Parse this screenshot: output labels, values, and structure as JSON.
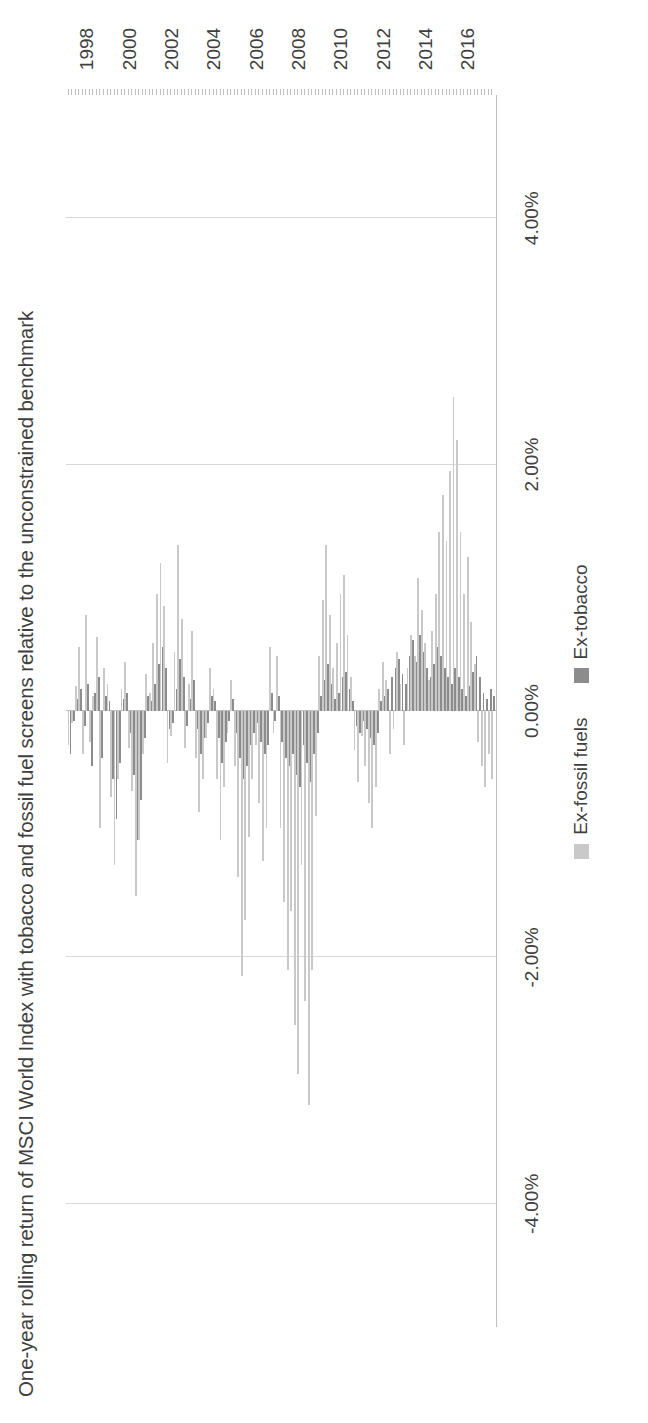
{
  "chart": {
    "title": "One-year rolling return of MSCI World Index with tobacco and fossil fuel screens relative to the unconstrained benchmark",
    "orientation": "rotated-90-ccw",
    "value_axis": {
      "labels": [
        "4.00%",
        "2.00%",
        "0.00%",
        "-2.00%",
        "-4.00%"
      ],
      "values": [
        4,
        2,
        0,
        -2,
        -4
      ],
      "min": -5,
      "max": 5
    },
    "category_axis": {
      "labels": [
        "1998",
        "2000",
        "2002",
        "2004",
        "2006",
        "2008",
        "2010",
        "2012",
        "2014",
        "2016"
      ],
      "values": [
        1998,
        2000,
        2002,
        2004,
        2006,
        2008,
        2010,
        2012,
        2014,
        2016
      ],
      "min": 1997.0,
      "max": 2017.3
    },
    "legend": {
      "position": "bottom",
      "items": [
        {
          "label": "Ex-fossil fuels",
          "color": "#c9c9c9"
        },
        {
          "label": "Ex-tobacco",
          "color": "#8c8c8c"
        }
      ]
    },
    "colors": {
      "ex_fossil_fuels": "#c9c9c9",
      "ex_tobacco": "#8c8c8c",
      "gridline": "#d9d9d9",
      "axis": "#bfbfbf",
      "text": "#3f3f3f",
      "background": "#ffffff"
    }
  },
  "chart_data": {
    "type": "bar",
    "title": "One-year rolling return of MSCI World Index with tobacco and fossil fuel screens relative to the unconstrained benchmark",
    "xlabel": "",
    "ylabel": "",
    "ylim": [
      -5,
      5
    ],
    "xlim": [
      1997.0,
      2017.3
    ],
    "grid": true,
    "legend_position": "bottom",
    "units": "percent",
    "x": [
      1997.08,
      1997.25,
      1997.42,
      1997.58,
      1997.75,
      1997.92,
      1998.08,
      1998.25,
      1998.42,
      1998.58,
      1998.75,
      1998.92,
      1999.08,
      1999.25,
      1999.42,
      1999.58,
      1999.75,
      1999.92,
      2000.08,
      2000.25,
      2000.42,
      2000.58,
      2000.75,
      2000.92,
      2001.08,
      2001.25,
      2001.42,
      2001.58,
      2001.75,
      2001.92,
      2002.08,
      2002.25,
      2002.42,
      2002.58,
      2002.75,
      2002.92,
      2003.08,
      2003.25,
      2003.42,
      2003.58,
      2003.75,
      2003.92,
      2004.08,
      2004.25,
      2004.42,
      2004.58,
      2004.75,
      2004.92,
      2005.08,
      2005.25,
      2005.42,
      2005.58,
      2005.75,
      2005.92,
      2006.08,
      2006.25,
      2006.42,
      2006.58,
      2006.75,
      2006.92,
      2007.08,
      2007.25,
      2007.42,
      2007.58,
      2007.75,
      2007.92,
      2008.08,
      2008.25,
      2008.42,
      2008.58,
      2008.75,
      2008.92,
      2009.08,
      2009.25,
      2009.42,
      2009.58,
      2009.75,
      2009.92,
      2010.08,
      2010.25,
      2010.42,
      2010.58,
      2010.75,
      2010.92,
      2011.08,
      2011.25,
      2011.42,
      2011.58,
      2011.75,
      2011.92,
      2012.08,
      2012.25,
      2012.42,
      2012.58,
      2012.75,
      2012.92,
      2013.08,
      2013.25,
      2013.42,
      2013.58,
      2013.75,
      2013.92,
      2014.08,
      2014.25,
      2014.42,
      2014.58,
      2014.75,
      2014.92,
      2015.08,
      2015.25,
      2015.42,
      2015.58,
      2015.75,
      2015.92,
      2016.08,
      2016.25,
      2016.42,
      2016.58,
      2016.75,
      2016.92,
      2017.08
    ],
    "series": [
      {
        "name": "Ex-fossil fuels",
        "color": "#c9c9c9",
        "values": [
          -0.28,
          -0.1,
          0.2,
          0.52,
          -0.35,
          0.78,
          -0.25,
          0.12,
          0.6,
          -0.95,
          0.35,
          0.22,
          -0.7,
          -1.25,
          -0.55,
          0.18,
          0.4,
          -0.3,
          -0.65,
          -1.5,
          -1.05,
          -0.35,
          0.3,
          0.15,
          0.55,
          0.95,
          1.2,
          0.85,
          -0.42,
          -0.2,
          0.48,
          1.35,
          0.75,
          -0.3,
          0.22,
          0.65,
          -0.38,
          -0.82,
          -0.55,
          -0.22,
          0.35,
          0.18,
          -0.55,
          -1.05,
          -0.62,
          -0.18,
          0.25,
          -0.45,
          -1.35,
          -2.15,
          -1.7,
          -1.02,
          -0.55,
          -0.28,
          -0.75,
          -1.22,
          -0.95,
          0.52,
          -0.18,
          0.45,
          -0.95,
          -1.55,
          -2.1,
          -1.62,
          -2.55,
          -2.95,
          -1.25,
          -2.35,
          -3.2,
          -2.1,
          -0.85,
          0.45,
          0.9,
          1.35,
          0.78,
          0.35,
          0.55,
          0.95,
          1.1,
          0.62,
          0.28,
          -0.32,
          -0.58,
          -0.2,
          -0.45,
          -0.75,
          -0.95,
          -0.62,
          0.18,
          0.4,
          0.25,
          -0.35,
          -0.15,
          0.48,
          0.22,
          -0.28,
          0.35,
          0.62,
          0.45,
          1.08,
          0.82,
          0.55,
          0.25,
          0.65,
          0.95,
          1.45,
          1.75,
          1.38,
          1.95,
          2.55,
          2.2,
          1.45,
          0.95,
          1.25,
          0.72,
          0.38,
          -0.25,
          -0.45,
          -0.62,
          -0.35,
          -0.55
        ]
      },
      {
        "name": "Ex-tobacco",
        "color": "#8c8c8c",
        "values": [
          -0.35,
          -0.08,
          0.1,
          0.18,
          -0.12,
          0.22,
          -0.45,
          0.15,
          0.28,
          -0.38,
          0.12,
          0.08,
          -0.55,
          -0.88,
          -0.42,
          0.1,
          0.15,
          -0.18,
          -0.52,
          -1.05,
          -0.72,
          -0.22,
          0.12,
          0.08,
          0.22,
          0.38,
          0.52,
          0.35,
          -0.15,
          -0.1,
          0.18,
          0.42,
          0.28,
          -0.12,
          0.1,
          0.25,
          -0.15,
          -0.35,
          -0.22,
          -0.1,
          0.12,
          0.08,
          -0.22,
          -0.42,
          -0.25,
          -0.08,
          0.1,
          -0.18,
          -0.38,
          -0.55,
          -0.45,
          -0.28,
          -0.18,
          -0.1,
          -0.25,
          -0.35,
          -0.28,
          0.15,
          -0.08,
          0.12,
          -0.25,
          -0.38,
          -0.45,
          -0.35,
          -0.52,
          -0.62,
          -0.28,
          -0.42,
          -0.58,
          -0.35,
          -0.18,
          0.12,
          0.25,
          0.38,
          0.22,
          0.1,
          0.15,
          0.28,
          0.32,
          0.18,
          0.08,
          -0.12,
          -0.18,
          -0.08,
          -0.15,
          -0.22,
          -0.28,
          -0.18,
          0.08,
          0.12,
          0.18,
          0.28,
          0.35,
          0.42,
          0.3,
          0.22,
          0.45,
          0.58,
          0.4,
          0.62,
          0.48,
          0.35,
          0.28,
          0.38,
          0.52,
          0.45,
          0.35,
          0.28,
          0.22,
          0.35,
          0.28,
          0.18,
          0.12,
          0.2,
          0.32,
          0.45,
          0.28,
          0.15,
          0.1,
          0.18,
          0.12
        ]
      }
    ]
  }
}
